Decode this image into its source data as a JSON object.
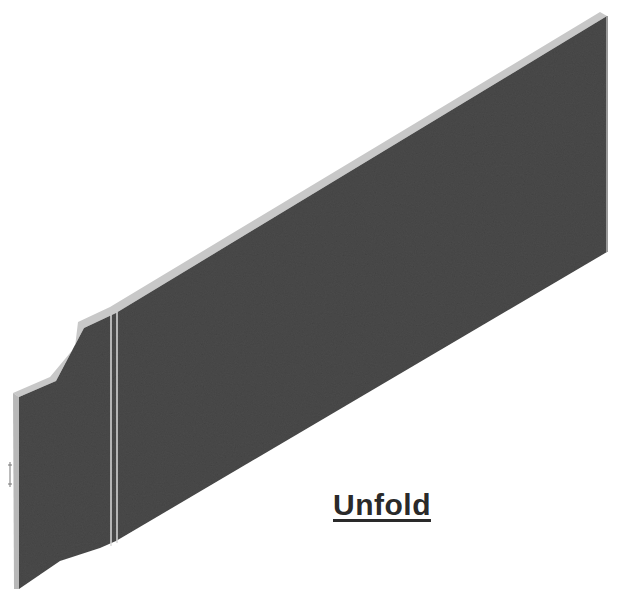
{
  "figure": {
    "caption": "Unfold",
    "colors": {
      "face": "#4a4a4a",
      "edge_highlight": "#c8c8c8",
      "bend_line": "#d8d8d8",
      "background": "#ffffff"
    }
  }
}
